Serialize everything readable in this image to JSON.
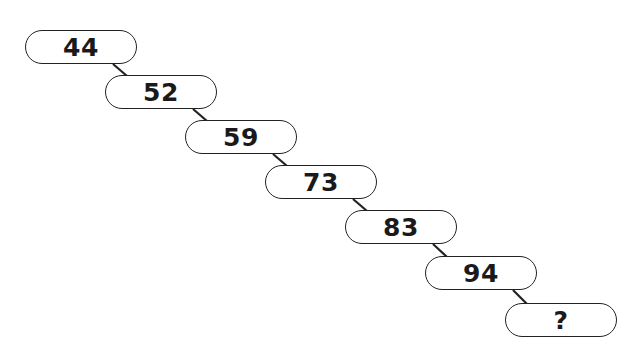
{
  "puzzle": {
    "type": "number-sequence",
    "items": [
      {
        "label": "44",
        "x": 25,
        "y": 30
      },
      {
        "label": "52",
        "x": 105,
        "y": 75
      },
      {
        "label": "59",
        "x": 185,
        "y": 120
      },
      {
        "label": "73",
        "x": 265,
        "y": 165
      },
      {
        "label": "83",
        "x": 345,
        "y": 210
      },
      {
        "label": "94",
        "x": 425,
        "y": 256
      },
      {
        "label": "?",
        "x": 505,
        "y": 303
      }
    ]
  },
  "colors": {
    "stroke": "#222222",
    "text": "#1a1a1a",
    "background": "#ffffff"
  }
}
